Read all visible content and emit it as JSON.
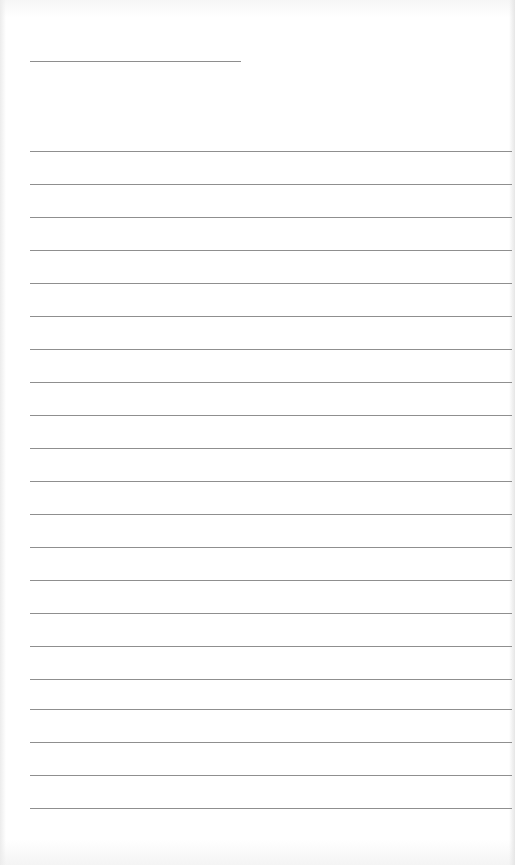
{
  "document": {
    "type": "blank lined writing sheet",
    "header_line": {
      "x": 30,
      "y": 61,
      "width": 211
    },
    "rules": {
      "count": 21,
      "start_x": 30,
      "width": 482,
      "y_positions": [
        151,
        184,
        217,
        250,
        283,
        316,
        349,
        382,
        415,
        448,
        481,
        514,
        547,
        580,
        613,
        646,
        679,
        709,
        742,
        775,
        808
      ]
    },
    "colors": {
      "paper": "#ffffff",
      "rule": "#8f8f8f"
    }
  }
}
